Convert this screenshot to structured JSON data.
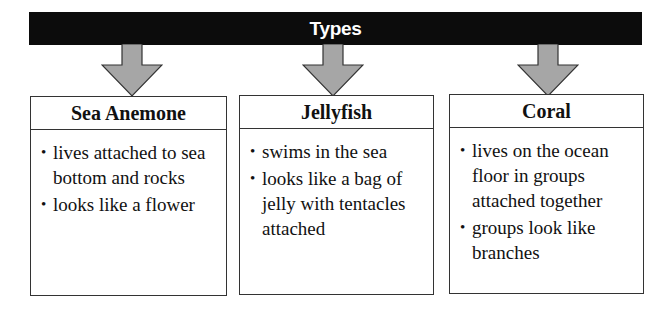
{
  "title": "Types",
  "colors": {
    "title_bar": "#0c0c0c",
    "arrow_fill": "#a6a6a6",
    "arrow_stroke": "#333333",
    "box_border": "#333333"
  },
  "arrows": [
    {
      "icon": "down-arrow-icon",
      "x": 101
    },
    {
      "icon": "down-arrow-icon",
      "x": 302
    },
    {
      "icon": "down-arrow-icon",
      "x": 517
    }
  ],
  "types": [
    {
      "name": "Sea Anemone",
      "bullets": [
        "lives attached to sea bottom and rocks",
        "looks like a flower"
      ]
    },
    {
      "name": "Jellyfish",
      "bullets": [
        "swims in the sea",
        "looks like a bag of jelly with tentacles attached"
      ]
    },
    {
      "name": "Coral",
      "bullets": [
        "lives on the ocean floor in groups attached together",
        "groups look like branches"
      ]
    }
  ],
  "bullet_glyph": "•"
}
